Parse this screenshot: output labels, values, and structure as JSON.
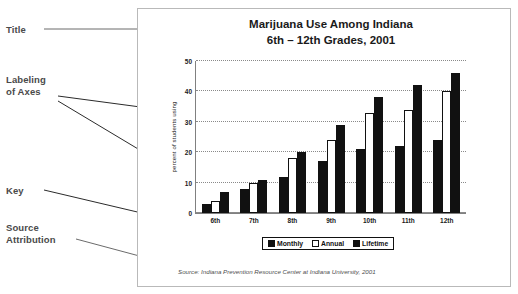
{
  "annotations": {
    "title_label": "Title",
    "axes_label": "Labeling\nof Axes",
    "key_label": "Key",
    "source_label": "Source\nAttribution"
  },
  "figure": {
    "title": "Marijuana Use Among Indiana\n6th – 12th Grades, 2001",
    "source": "Source: Indiana Prevention Resource Center at Indiana University, 2001"
  },
  "chart_data": {
    "type": "bar",
    "title": "Marijuana Use Among Indiana 6th – 12th Grades, 2001",
    "xlabel": "",
    "ylabel": "percent of students using",
    "ylim": [
      0,
      50
    ],
    "yticks": [
      0,
      10,
      20,
      30,
      40,
      50
    ],
    "grid": true,
    "legend_position": "bottom",
    "categories": [
      "6th",
      "7th",
      "8th",
      "9th",
      "10th",
      "11th",
      "12th"
    ],
    "series": [
      {
        "name": "Monthly",
        "color": "#111111",
        "values": [
          3,
          8,
          12,
          17,
          21,
          22,
          24
        ]
      },
      {
        "name": "Annual",
        "color": "#ffffff",
        "values": [
          4,
          10,
          18,
          24,
          33,
          34,
          40
        ]
      },
      {
        "name": "Lifetime",
        "color": "#111111",
        "values": [
          7,
          11,
          20,
          29,
          38,
          42,
          46
        ]
      }
    ]
  }
}
